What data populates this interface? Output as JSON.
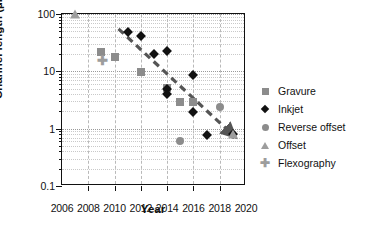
{
  "chart_data": {
    "type": "scatter",
    "title": "",
    "xlabel": "Year",
    "ylabel": "Channel length (µm)",
    "xlim": [
      2006,
      2020
    ],
    "ylim": [
      0.1,
      100
    ],
    "yscale": "log",
    "xscale": "linear",
    "grid": true,
    "legend_position": "right",
    "xticks": [
      "2006",
      "2008",
      "2010",
      "2012",
      "2014",
      "2016",
      "2018",
      "2020"
    ],
    "xtick_values": [
      2006,
      2008,
      2010,
      2012,
      2014,
      2016,
      2018,
      2020
    ],
    "yticks": [
      "0.1",
      "1",
      "10",
      "100"
    ],
    "ytick_values": [
      0.1,
      1,
      10,
      100
    ],
    "series": [
      {
        "name": "Gravure",
        "marker": "square",
        "color": "#8c8c8c",
        "points": [
          {
            "x": 2009,
            "y": 22
          },
          {
            "x": 2010,
            "y": 18
          },
          {
            "x": 2012,
            "y": 9.8
          },
          {
            "x": 2014,
            "y": 5.2
          },
          {
            "x": 2015,
            "y": 2.9
          },
          {
            "x": 2016,
            "y": 2.9
          }
        ]
      },
      {
        "name": "Inkjet",
        "marker": "diamond",
        "color": "#111111",
        "points": [
          {
            "x": 2011,
            "y": 48
          },
          {
            "x": 2012,
            "y": 41
          },
          {
            "x": 2013,
            "y": 20
          },
          {
            "x": 2014,
            "y": 23
          },
          {
            "x": 2014,
            "y": 5.0
          },
          {
            "x": 2014,
            "y": 4.0
          },
          {
            "x": 2016,
            "y": 8.8
          },
          {
            "x": 2016,
            "y": 1.95
          },
          {
            "x": 2017,
            "y": 0.79
          },
          {
            "x": 2019,
            "y": 0.8
          }
        ]
      },
      {
        "name": "Reverse offset",
        "marker": "circle",
        "color": "#8c8c8c",
        "points": [
          {
            "x": 2015,
            "y": 0.6
          },
          {
            "x": 2018,
            "y": 2.4
          }
        ]
      },
      {
        "name": "Offset",
        "marker": "triangle",
        "color": "#9d9d9d",
        "points": [
          {
            "x": 2007,
            "y": 100
          },
          {
            "x": 2019,
            "y": 0.8
          }
        ]
      },
      {
        "name": "Flexography",
        "marker": "plus",
        "color": "#9d9d9d",
        "points": [
          {
            "x": 2009,
            "y": 16
          }
        ]
      }
    ],
    "annotations": [
      {
        "type": "trend-arrow",
        "style": "dashed",
        "color": "#555555",
        "from": {
          "x": 2010.3,
          "y": 55
        },
        "to": {
          "x": 2019.0,
          "y": 0.78
        }
      }
    ]
  }
}
